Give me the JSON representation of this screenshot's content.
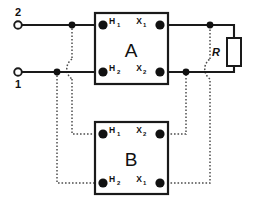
{
  "diagram": {
    "units": [
      {
        "id": "A",
        "label": "A",
        "terminals": [
          {
            "id": "a-h1",
            "base": "H",
            "sub": "1",
            "position": "top-left"
          },
          {
            "id": "a-x1",
            "base": "X",
            "sub": "1",
            "position": "top-right"
          },
          {
            "id": "a-h2",
            "base": "H",
            "sub": "2",
            "position": "bottom-left"
          },
          {
            "id": "a-x2",
            "base": "X",
            "sub": "2",
            "position": "bottom-right"
          }
        ]
      },
      {
        "id": "B",
        "label": "B",
        "terminals": [
          {
            "id": "b-h1",
            "base": "H",
            "sub": "1",
            "position": "top-left"
          },
          {
            "id": "b-x2",
            "base": "X",
            "sub": "2",
            "position": "top-right"
          },
          {
            "id": "b-h2",
            "base": "H",
            "sub": "2",
            "position": "bottom-left"
          },
          {
            "id": "b-x1",
            "base": "X",
            "sub": "1",
            "position": "bottom-right"
          }
        ]
      }
    ],
    "source_terminals": [
      {
        "id": "line-2",
        "label": "2",
        "position": "upper-left"
      },
      {
        "id": "line-1",
        "label": "1",
        "position": "lower-left"
      }
    ],
    "load": {
      "id": "resistor-R",
      "label": "R",
      "type": "resistor"
    },
    "colors": {
      "wire_solid": "#1a1a1a",
      "wire_dotted": "#4d4d4d",
      "terminal_fill": "#111111",
      "background": "#ffffff"
    },
    "legend": {
      "solid_meaning": "solid line",
      "dotted_meaning": "dotted line"
    }
  }
}
